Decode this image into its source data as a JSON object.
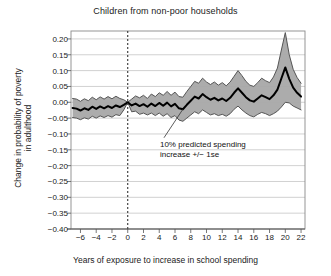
{
  "chart_data": {
    "type": "area",
    "title": "Children from non-poor households",
    "xlabel": "Years of exposure to increase in school spending",
    "ylabel_line1": "Change in probability of poverty",
    "ylabel_line2": "in adulthood",
    "xlim": [
      -7.2,
      22.5
    ],
    "ylim": [
      -0.4,
      0.225
    ],
    "xticks": [
      -6,
      -4,
      -2,
      0,
      2,
      4,
      6,
      8,
      10,
      12,
      14,
      16,
      18,
      20,
      22
    ],
    "xtick_labels": [
      "−6",
      "−4",
      "−2",
      "0",
      "2",
      "4",
      "6",
      "8",
      "10",
      "12",
      "14",
      "16",
      "18",
      "20",
      "22"
    ],
    "yticks": [
      0.2,
      0.15,
      0.1,
      0.05,
      0.0,
      -0.05,
      -0.1,
      -0.15,
      -0.2,
      -0.25,
      -0.3,
      -0.35,
      -0.4
    ],
    "ytick_labels": [
      "0.20",
      "0.15",
      "0.10",
      "0.05",
      "0.00",
      "−0.05",
      "−0.10",
      "−0.15",
      "−0.20",
      "−0.25",
      "−0.30",
      "−0.35",
      "−0.40"
    ],
    "grid": "horizontal",
    "legend": "none",
    "reference_line": {
      "x": 0,
      "style": "dashed",
      "color": "#333333"
    },
    "annotation": {
      "line1": "10% predicted spending",
      "line2": "increase +/− 1se",
      "leader_from": {
        "x": 7.0,
        "y": -0.022
      },
      "leader_to": {
        "x": 4.6,
        "y": -0.112
      }
    },
    "band_fill_color": "#a8a8a8",
    "band_edge_color": "#555555",
    "center_line_color": "#000000",
    "series": [
      {
        "name": "point estimate",
        "x": [
          -7,
          -6.5,
          -6,
          -5.5,
          -5,
          -4.5,
          -4,
          -3.5,
          -3,
          -2.5,
          -2,
          -1.5,
          -1,
          -0.5,
          0,
          0.5,
          1,
          1.5,
          2,
          2.5,
          3,
          3.5,
          4,
          4.5,
          5,
          5.5,
          6,
          6.5,
          7,
          7.5,
          8,
          8.5,
          9,
          9.5,
          10,
          10.5,
          11,
          11.5,
          12,
          12.5,
          13,
          13.5,
          14,
          14.5,
          15,
          15.5,
          16,
          16.5,
          17,
          17.5,
          18,
          18.5,
          19,
          19.5,
          20,
          20.5,
          21,
          21.5,
          22
        ],
        "values": [
          -0.018,
          -0.02,
          -0.026,
          -0.019,
          -0.024,
          -0.014,
          -0.021,
          -0.013,
          -0.019,
          -0.012,
          -0.018,
          -0.01,
          -0.015,
          -0.008,
          0.0,
          -0.01,
          -0.004,
          -0.012,
          -0.006,
          -0.014,
          -0.004,
          -0.012,
          -0.002,
          -0.011,
          -0.001,
          -0.013,
          -0.005,
          -0.019,
          -0.022,
          -0.008,
          0.005,
          0.018,
          0.012,
          0.026,
          0.016,
          0.008,
          0.014,
          0.006,
          0.012,
          0.004,
          0.014,
          0.03,
          0.044,
          0.03,
          0.016,
          0.006,
          0.002,
          0.012,
          0.022,
          0.016,
          0.01,
          0.022,
          0.04,
          0.075,
          0.11,
          0.074,
          0.046,
          0.03,
          0.018
        ]
      },
      {
        "name": "upper 1se",
        "x": [
          -7,
          -6.5,
          -6,
          -5.5,
          -5,
          -4.5,
          -4,
          -3.5,
          -3,
          -2.5,
          -2,
          -1.5,
          -1,
          -0.5,
          0,
          0.5,
          1,
          1.5,
          2,
          2.5,
          3,
          3.5,
          4,
          4.5,
          5,
          5.5,
          6,
          6.5,
          7,
          7.5,
          8,
          8.5,
          9,
          9.5,
          10,
          10.5,
          11,
          11.5,
          12,
          12.5,
          13,
          13.5,
          14,
          14.5,
          15,
          15.5,
          16,
          16.5,
          17,
          17.5,
          18,
          18.5,
          19,
          19.5,
          20,
          20.5,
          21,
          21.5,
          22
        ],
        "values": [
          0.012,
          0.01,
          0.003,
          0.011,
          0.005,
          0.016,
          0.008,
          0.017,
          0.01,
          0.018,
          0.011,
          0.019,
          0.012,
          0.008,
          0.0,
          0.01,
          0.02,
          0.014,
          0.022,
          0.012,
          0.026,
          0.018,
          0.03,
          0.022,
          0.034,
          0.022,
          0.032,
          0.018,
          0.016,
          0.034,
          0.05,
          0.066,
          0.06,
          0.076,
          0.064,
          0.056,
          0.064,
          0.054,
          0.062,
          0.052,
          0.064,
          0.082,
          0.1,
          0.084,
          0.066,
          0.054,
          0.05,
          0.062,
          0.076,
          0.068,
          0.062,
          0.08,
          0.108,
          0.165,
          0.22,
          0.15,
          0.104,
          0.078,
          0.06
        ]
      },
      {
        "name": "lower 1se",
        "x": [
          -7,
          -6.5,
          -6,
          -5.5,
          -5,
          -4.5,
          -4,
          -3.5,
          -3,
          -2.5,
          -2,
          -1.5,
          -1,
          -0.5,
          0,
          0.5,
          1,
          1.5,
          2,
          2.5,
          3,
          3.5,
          4,
          4.5,
          5,
          5.5,
          6,
          6.5,
          7,
          7.5,
          8,
          8.5,
          9,
          9.5,
          10,
          10.5,
          11,
          11.5,
          12,
          12.5,
          13,
          13.5,
          14,
          14.5,
          15,
          15.5,
          16,
          16.5,
          17,
          17.5,
          18,
          18.5,
          19,
          19.5,
          20,
          20.5,
          21,
          21.5,
          22
        ],
        "values": [
          -0.048,
          -0.05,
          -0.055,
          -0.049,
          -0.053,
          -0.044,
          -0.05,
          -0.043,
          -0.048,
          -0.042,
          -0.047,
          -0.039,
          -0.042,
          -0.024,
          0.0,
          -0.03,
          -0.028,
          -0.038,
          -0.034,
          -0.04,
          -0.034,
          -0.042,
          -0.034,
          -0.044,
          -0.036,
          -0.048,
          -0.042,
          -0.056,
          -0.06,
          -0.05,
          -0.04,
          -0.03,
          -0.036,
          -0.024,
          -0.032,
          -0.04,
          -0.036,
          -0.042,
          -0.038,
          -0.044,
          -0.036,
          -0.022,
          -0.012,
          -0.024,
          -0.034,
          -0.042,
          -0.046,
          -0.038,
          -0.032,
          -0.036,
          -0.042,
          -0.036,
          -0.028,
          -0.015,
          0.0,
          -0.002,
          -0.012,
          -0.018,
          -0.024
        ]
      }
    ]
  }
}
